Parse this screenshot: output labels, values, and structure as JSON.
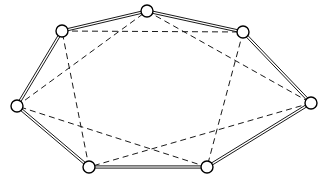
{
  "figure": {
    "width": 325,
    "height": 187,
    "background_color": "#ffffff"
  },
  "style": {
    "node_fill": "#ffffff",
    "node_stroke": "#000000",
    "node_radius": 6,
    "node_stroke_width": 1.4,
    "outer_edge_color": "#1a1a1a",
    "outer_edge_width": 1,
    "outer_edge_style": "solid-double",
    "outer_edge_offset": 2.2,
    "chord_edge_color": "#1a1a1a",
    "chord_edge_width": 1,
    "chord_edge_style": "dashed",
    "chord_dash_pattern": "6 4"
  },
  "graph": {
    "type": "circulant-graph",
    "node_count": 7,
    "outer_edge_count": 7,
    "chord_edge_count": 7,
    "nodes": [
      {
        "id": "n0",
        "name": "top-center-node",
        "x": 147,
        "y": 11
      },
      {
        "id": "n1",
        "name": "top-right-node",
        "x": 243,
        "y": 32
      },
      {
        "id": "n2",
        "name": "right-node",
        "x": 311,
        "y": 103
      },
      {
        "id": "n3",
        "name": "bottom-right-node",
        "x": 207,
        "y": 167
      },
      {
        "id": "n4",
        "name": "bottom-left-node",
        "x": 89,
        "y": 167
      },
      {
        "id": "n5",
        "name": "left-node",
        "x": 17,
        "y": 106
      },
      {
        "id": "n6",
        "name": "top-left-node",
        "x": 62,
        "y": 31
      }
    ],
    "outer_edges": [
      {
        "from": "n0",
        "to": "n1"
      },
      {
        "from": "n1",
        "to": "n2"
      },
      {
        "from": "n2",
        "to": "n3"
      },
      {
        "from": "n3",
        "to": "n4"
      },
      {
        "from": "n4",
        "to": "n5"
      },
      {
        "from": "n5",
        "to": "n6"
      },
      {
        "from": "n6",
        "to": "n0"
      }
    ],
    "chord_edges": [
      {
        "from": "n6",
        "to": "n1"
      },
      {
        "from": "n0",
        "to": "n2"
      },
      {
        "from": "n1",
        "to": "n3"
      },
      {
        "from": "n2",
        "to": "n4"
      },
      {
        "from": "n3",
        "to": "n5"
      },
      {
        "from": "n4",
        "to": "n6"
      },
      {
        "from": "n5",
        "to": "n0"
      }
    ]
  }
}
